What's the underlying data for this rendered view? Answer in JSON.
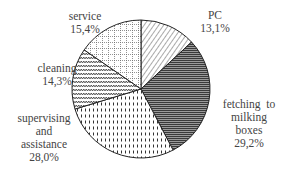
{
  "chart_data": {
    "type": "pie",
    "title": "",
    "categories": [
      "PC",
      "fetching to milking boxes",
      "supervising and assistance",
      "cleaning",
      "service"
    ],
    "values": [
      13.1,
      29.2,
      28.0,
      14.3,
      15.4
    ],
    "unit": "%",
    "start_angle": "12 o'clock",
    "direction": "clockwise",
    "legend": "none (direct labels)",
    "slices": [
      {
        "name": "PC",
        "value": 13.1,
        "label_lines": [
          "PC",
          "13,1%"
        ],
        "pattern": "diagonal-hatch"
      },
      {
        "name": "fetching to milking boxes",
        "value": 29.2,
        "label_lines": [
          "fetching  to",
          "milking",
          "boxes",
          "29,2%"
        ],
        "pattern": "dense-horizontal-lines"
      },
      {
        "name": "supervising and assistance",
        "value": 28.0,
        "label_lines": [
          "supervising",
          "and",
          "assistance",
          "28,0%"
        ],
        "pattern": "vertical-dashes"
      },
      {
        "name": "cleaning",
        "value": 14.3,
        "label_lines": [
          "cleaning",
          "14,3%"
        ],
        "pattern": "zigzag"
      },
      {
        "name": "service",
        "value": 15.4,
        "label_lines": [
          "service",
          "15,4%"
        ],
        "pattern": "dotted-grid"
      }
    ]
  },
  "labels": {
    "pc": {
      "name": "PC",
      "value": "13,1%"
    },
    "fetching": {
      "line1": "fetching  to",
      "line2": "milking",
      "line3": "boxes",
      "value": "29,2%"
    },
    "supervising": {
      "line1": "supervising",
      "line2": "and",
      "line3": "assistance",
      "value": "28,0%"
    },
    "cleaning": {
      "name": "cleaning",
      "value": "14,3%"
    },
    "service": {
      "name": "service",
      "value": "15,4%"
    }
  }
}
